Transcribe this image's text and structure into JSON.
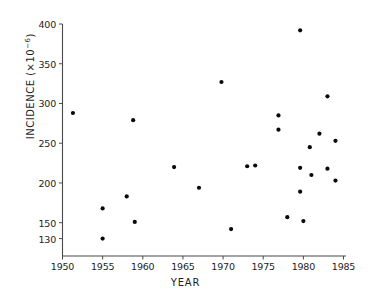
{
  "chart_data": {
    "type": "scatter",
    "title": "",
    "xlabel": "YEAR",
    "ylabel_text": "INCIDENCE (×10",
    "ylabel_exp": "−6",
    "ylabel_tail": ")",
    "ylabel_full": "INCIDENCE (×10⁻⁶)",
    "xlim": [
      1949,
      1986
    ],
    "ylim": [
      122,
      405
    ],
    "grid": false,
    "legend": "none",
    "xticks": [
      1950,
      1955,
      1960,
      1965,
      1970,
      1975,
      1980,
      1985
    ],
    "xtick_labels": [
      "1950",
      "1955",
      "1960",
      "1965",
      "1970",
      "1975",
      "1980",
      "1985"
    ],
    "yticks": [
      130,
      150,
      200,
      250,
      300,
      350,
      400
    ],
    "ytick_labels": [
      "130",
      "150",
      "200",
      "250",
      "300",
      "350",
      "400"
    ],
    "marker": "filled-circle",
    "marker_color": "#0a0a0a",
    "axis_color": "#4a4a4a",
    "points": [
      {
        "x": 1951.3,
        "y": 288
      },
      {
        "x": 1955.0,
        "y": 168
      },
      {
        "x": 1955.0,
        "y": 130
      },
      {
        "x": 1958.0,
        "y": 183
      },
      {
        "x": 1958.8,
        "y": 279
      },
      {
        "x": 1959.0,
        "y": 151
      },
      {
        "x": 1963.9,
        "y": 220
      },
      {
        "x": 1967.0,
        "y": 194
      },
      {
        "x": 1969.8,
        "y": 327
      },
      {
        "x": 1971.0,
        "y": 142
      },
      {
        "x": 1973.0,
        "y": 221
      },
      {
        "x": 1974.0,
        "y": 222
      },
      {
        "x": 1976.9,
        "y": 285
      },
      {
        "x": 1976.9,
        "y": 267
      },
      {
        "x": 1978.0,
        "y": 157
      },
      {
        "x": 1979.6,
        "y": 392
      },
      {
        "x": 1979.6,
        "y": 219
      },
      {
        "x": 1979.6,
        "y": 189
      },
      {
        "x": 1980.0,
        "y": 152
      },
      {
        "x": 1980.8,
        "y": 245
      },
      {
        "x": 1981.0,
        "y": 210
      },
      {
        "x": 1982.0,
        "y": 262
      },
      {
        "x": 1983.0,
        "y": 309
      },
      {
        "x": 1983.0,
        "y": 218
      },
      {
        "x": 1984.0,
        "y": 253
      },
      {
        "x": 1984.0,
        "y": 203
      }
    ]
  },
  "axes": {
    "x_axis_name": "year-axis",
    "y_axis_name": "incidence-axis"
  }
}
